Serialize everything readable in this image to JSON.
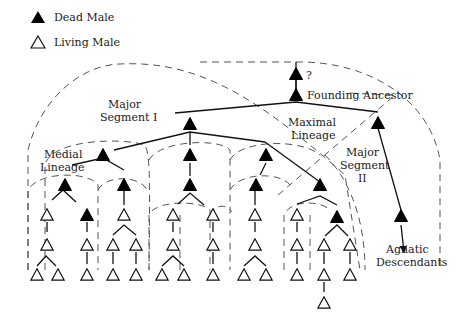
{
  "legend": {
    "dead": {
      "label": "Dead Male",
      "symbol": "filled-triangle",
      "color": "#000000"
    },
    "living": {
      "label": "Living Male",
      "symbol": "open-triangle",
      "color": "#ffffff"
    }
  },
  "labels": {
    "unknown": "?",
    "founding_ancestor": "Founding Ancestor",
    "major_segment_1_line1": "Major",
    "major_segment_1_line2": "Segment I",
    "maximal_lineage_line1": "Maximal",
    "maximal_lineage_line2": "Lineage",
    "major_segment_2_line1": "Major",
    "major_segment_2_line2": "Segment",
    "major_segment_2_line3": "II",
    "medial_lineage_line1": "Medial",
    "medial_lineage_line2": "Lineage",
    "agnatic_line1": "Agnatic",
    "agnatic_line2": "Descendants"
  },
  "diagram": {
    "node_types": [
      "dead-male",
      "living-male"
    ],
    "levels": [
      "Unknown ancestor",
      "Founding Ancestor",
      "Maximal Lineage",
      "Major Segment I",
      "Major Segment II",
      "Medial Lineage",
      "Agnatic Descendants"
    ]
  }
}
